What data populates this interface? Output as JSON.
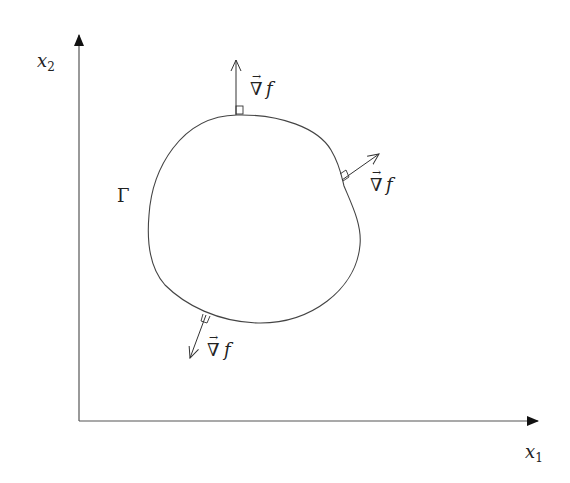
{
  "diagram": {
    "title": "",
    "axes": {
      "x_label": "x",
      "x_subscript": "1",
      "y_label": "x",
      "y_subscript": "2"
    },
    "curve": {
      "label": "Γ",
      "description": "closed smooth boundary curve"
    },
    "normals": [
      {
        "id": "top",
        "label_symbol": "∇",
        "label_var": "f",
        "vector_mark": "→"
      },
      {
        "id": "right",
        "label_symbol": "∇",
        "label_var": "f",
        "vector_mark": "→"
      },
      {
        "id": "bottom",
        "label_symbol": "∇",
        "label_var": "f",
        "vector_mark": "→"
      }
    ],
    "colors": {
      "stroke": "#333333",
      "text": "#222222",
      "background": "#ffffff"
    }
  }
}
